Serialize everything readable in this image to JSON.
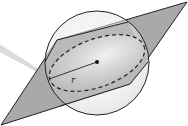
{
  "diagram": {
    "radius_label": "r",
    "colors": {
      "background": "#ffffff",
      "sphere_fill_light": "#f2f2f2",
      "sphere_fill_dark": "#cfcfcf",
      "plane_fill": "#a8a8a8",
      "plane_inner_fill": "#bdbdbd",
      "outline": "#222222",
      "ray": "#c8c8c8"
    }
  }
}
